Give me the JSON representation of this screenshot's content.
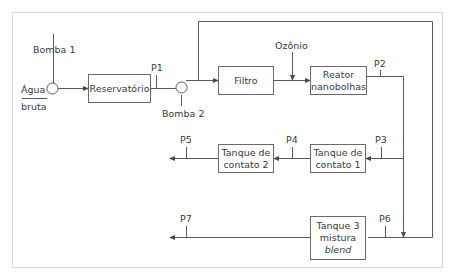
{
  "diagram": {
    "type": "process-flow",
    "source": {
      "line1": "Água",
      "line2": "bruta"
    },
    "pumps": [
      {
        "label": "Bomba 1"
      },
      {
        "label": "Bomba 2"
      }
    ],
    "units": {
      "reservatorio": {
        "line1": "Reservatório"
      },
      "filtro": {
        "line1": "Filtro"
      },
      "reator": {
        "line1": "Reator",
        "line2": "nanobolhas"
      },
      "tanque1": {
        "line1": "Tanque de",
        "line2": "contato 1"
      },
      "tanque2": {
        "line1": "Tanque de",
        "line2": "contato 2"
      },
      "tanque3": {
        "line1": "Tanque 3",
        "line2": "mistura",
        "line3": "blend"
      }
    },
    "inputs": {
      "ozonio": "Ozônio"
    },
    "points": {
      "p1": "P1",
      "p2": "P2",
      "p3": "P3",
      "p4": "P4",
      "p5": "P5",
      "p6": "P6",
      "p7": "P7"
    },
    "edges": [
      {
        "from": "Água bruta",
        "to": "Reservatório",
        "via": "Bomba 1"
      },
      {
        "from": "Reservatório",
        "to": "Filtro",
        "via": "Bomba 2",
        "point": "P1"
      },
      {
        "from": "Bomba 2",
        "to": "Tanque 3 mistura",
        "via": "bypass"
      },
      {
        "from": "Filtro",
        "to": "Reator nanobolhas",
        "input": "Ozônio"
      },
      {
        "from": "Reator nanobolhas",
        "to": "Tanque de contato 1",
        "point": "P2/P3"
      },
      {
        "from": "Reator nanobolhas",
        "to": "Tanque 3 mistura",
        "point": "P6"
      },
      {
        "from": "Tanque de contato 1",
        "to": "Tanque de contato 2",
        "point": "P4"
      },
      {
        "from": "Tanque de contato 2",
        "to": "out",
        "point": "P5"
      },
      {
        "from": "Tanque 3 mistura",
        "to": "out",
        "point": "P7"
      }
    ]
  }
}
